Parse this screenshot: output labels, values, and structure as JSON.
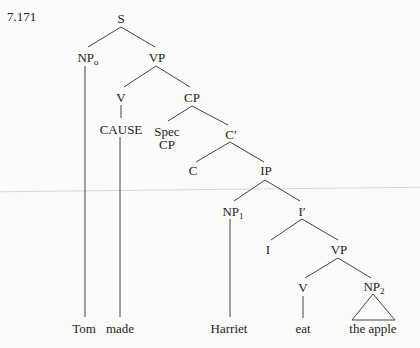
{
  "example_number": "7.171",
  "nodes": {
    "s": "S",
    "np0": {
      "base": "NP",
      "sub": "o"
    },
    "vp1": "VP",
    "v1": "V",
    "cp": "CP",
    "cause": "CAUSE",
    "spec_cp_line1": "Spec",
    "spec_cp_line2": "CP",
    "c_bar": "C′",
    "c": "C",
    "ip": "IP",
    "np1": {
      "base": "NP",
      "sub": "1"
    },
    "i_bar": "I′",
    "i": "I",
    "vp2": "VP",
    "v2": "V",
    "np2": {
      "base": "NP",
      "sub": "2"
    }
  },
  "terminals": {
    "tom": "Tom",
    "made": "made",
    "harriet": "Harriet",
    "eat": "eat",
    "the_apple": "the apple"
  },
  "colors": {
    "ink": "#222222",
    "line": "#444444",
    "background": "#fbfbf9"
  }
}
